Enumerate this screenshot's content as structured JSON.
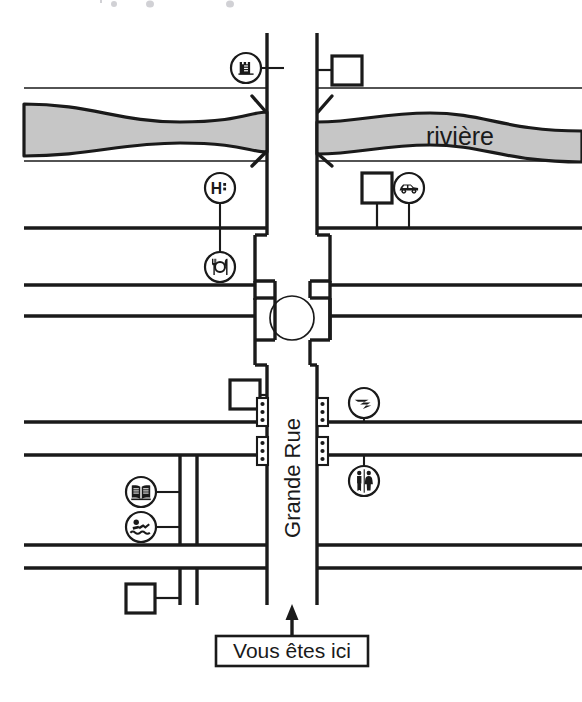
{
  "map": {
    "title": "Plan de ville - Vous etes ici",
    "colors": {
      "ink": "#1a1a1a",
      "river_fill": "#c6c6c6",
      "paper": "#ffffff",
      "road_line": "#1a1a1a"
    },
    "labels": {
      "river": "rivière",
      "main_street": "Grande Rue",
      "you_are_here": "Vous êtes ici"
    },
    "pois": [
      {
        "id": "castle",
        "icon": "castle-icon",
        "name": "Château / monument",
        "x": 246,
        "y": 68,
        "r": 15,
        "stem": "right",
        "stem_len": 26
      },
      {
        "id": "hospital",
        "icon": "hospital-icon",
        "name": "Hôpital",
        "x": 220,
        "y": 188,
        "r": 15,
        "stem": "down",
        "stem_len": 38
      },
      {
        "id": "garage",
        "icon": "car-icon",
        "name": "Garage / parking",
        "x": 409,
        "y": 188,
        "r": 15,
        "stem": "down",
        "stem_len": 38
      },
      {
        "id": "restaurant",
        "icon": "restaurant-icon",
        "name": "Restaurant",
        "x": 220,
        "y": 267,
        "r": 15,
        "stem": "up",
        "stem_len": 34
      },
      {
        "id": "post",
        "icon": "post-office-icon",
        "name": "La Poste",
        "x": 364,
        "y": 403,
        "r": 15,
        "stem": "down",
        "stem_len": 33
      },
      {
        "id": "library",
        "icon": "book-icon",
        "name": "Bibliothèque",
        "x": 141,
        "y": 492,
        "r": 15,
        "stem": "right",
        "stem_len": 36
      },
      {
        "id": "pool",
        "icon": "swimmer-icon",
        "name": "Piscine",
        "x": 141,
        "y": 527,
        "r": 15,
        "stem": "right",
        "stem_len": 36
      },
      {
        "id": "toilets",
        "icon": "toilets-icon",
        "name": "Toilettes",
        "x": 364,
        "y": 481,
        "r": 15,
        "stem": "up",
        "stem_len": 37
      }
    ],
    "buildings": [
      {
        "id": "b-top-right",
        "name": "building-top-right",
        "x": 332,
        "y": 56,
        "w": 30,
        "h": 29,
        "stem": "left",
        "stem_len": 14
      },
      {
        "id": "b-mid-right",
        "name": "building-mid-right",
        "x": 362,
        "y": 173,
        "w": 30,
        "h": 30,
        "stem": "down",
        "stem_len": 27
      },
      {
        "id": "b-mid-left",
        "name": "building-mid-left",
        "x": 230,
        "y": 380,
        "w": 30,
        "h": 29,
        "stem": "right",
        "stem_len": 14
      },
      {
        "id": "b-bottom-left",
        "name": "building-bottom-left",
        "x": 126,
        "y": 584,
        "w": 29,
        "h": 29,
        "stem": "right",
        "stem_len": 16
      }
    ],
    "traffic_lights": [
      {
        "id": "tl-nw",
        "name": "traffic-light-north-west",
        "x": 262,
        "y": 398
      },
      {
        "id": "tl-ne",
        "name": "traffic-light-north-east",
        "x": 322,
        "y": 398
      },
      {
        "id": "tl-sw",
        "name": "traffic-light-south-west",
        "x": 262,
        "y": 437
      },
      {
        "id": "tl-se",
        "name": "traffic-light-south-east",
        "x": 322,
        "y": 437
      }
    ],
    "features": {
      "roundabout": {
        "name": "roundabout",
        "cx": 292,
        "cy": 318,
        "r": 22
      },
      "you_are_here_box": {
        "x": 216,
        "y": 636,
        "w": 152,
        "h": 30
      },
      "arrow": {
        "x": 292,
        "y_from": 636,
        "y_to": 606
      }
    }
  }
}
